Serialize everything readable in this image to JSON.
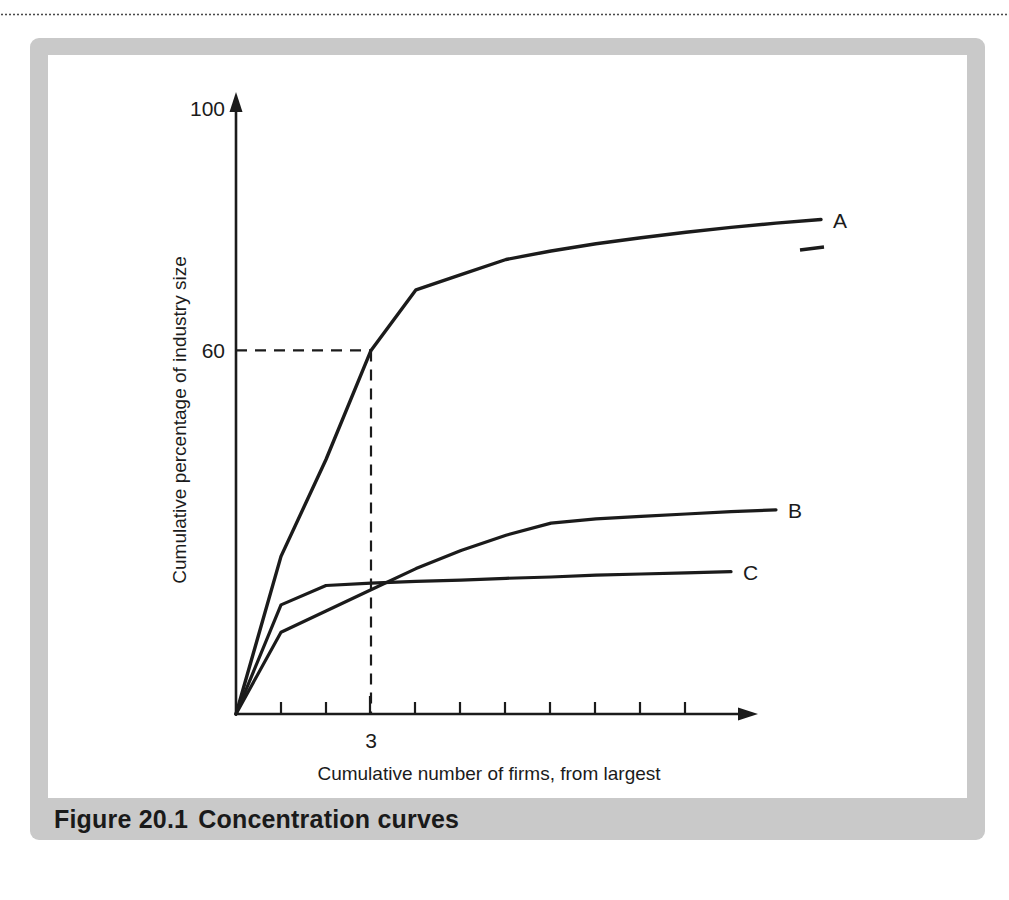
{
  "page": {
    "clipped_headline": "",
    "rule": "dotted-separator"
  },
  "figure": {
    "caption_number": "Figure 20.1",
    "caption_title": "Concentration curves",
    "frame_color": "#c9c9c9",
    "plot_background": "#ffffff",
    "line_color": "#1b1b1b"
  },
  "chart_data": {
    "type": "line",
    "title": "Concentration curves",
    "xlabel": "Cumulative number of firms, from largest",
    "ylabel": "Cumulative percentage of industry size",
    "xlim": [
      0,
      13
    ],
    "ylim": [
      0,
      100
    ],
    "grid": false,
    "legend": "inline-end-labels",
    "x_ticks": [
      1,
      2,
      3,
      4,
      5,
      6,
      7,
      8,
      9,
      10,
      11
    ],
    "x_tick_labels": [
      "",
      "",
      "3",
      "",
      "",
      "",
      "",
      "",
      "",
      "",
      ""
    ],
    "y_ticks": [
      60,
      100
    ],
    "y_tick_labels": [
      "60",
      "100"
    ],
    "annotations": [
      {
        "name": "guide-lines",
        "text": "",
        "style": "dashed",
        "x": 3,
        "y": 60,
        "description": "Dashed guide from y-axis at 60 across to curve A at 3 firms, then down to x-axis"
      }
    ],
    "series": [
      {
        "name": "A",
        "label": "A",
        "x": [
          0,
          1,
          2,
          3,
          4,
          5,
          6,
          7,
          8,
          9,
          10,
          11,
          12,
          13
        ],
        "y": [
          0,
          26,
          42,
          60,
          70,
          72.5,
          75,
          76.4,
          77.6,
          78.6,
          79.5,
          80.3,
          81,
          81.6
        ]
      },
      {
        "name": "B",
        "label": "B",
        "x": [
          0,
          1,
          2,
          3,
          4,
          5,
          6,
          7,
          8,
          9,
          10,
          11,
          12
        ],
        "y": [
          0,
          13.5,
          17,
          20.5,
          24,
          27,
          29.5,
          31.5,
          32.2,
          32.6,
          33,
          33.4,
          33.7
        ]
      },
      {
        "name": "C",
        "label": "C",
        "x": [
          0,
          1,
          2,
          3,
          4,
          5,
          6,
          7,
          8,
          9,
          10,
          11
        ],
        "y": [
          0,
          18,
          21.2,
          21.6,
          21.9,
          22.1,
          22.4,
          22.6,
          22.9,
          23.1,
          23.3,
          23.5
        ]
      }
    ]
  }
}
